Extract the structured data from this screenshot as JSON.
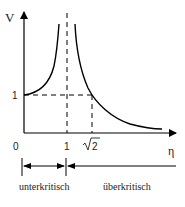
{
  "diagram": {
    "type": "resonance-curve",
    "y_axis": {
      "label": "V"
    },
    "x_axis": {
      "label": "η"
    },
    "y_ticks": [
      {
        "label": "1",
        "value": 1
      }
    ],
    "x_ticks": [
      {
        "label": "0",
        "value": 0
      },
      {
        "label": "1",
        "value": 1
      },
      {
        "label": "2",
        "prefix": "√",
        "value": 1.414
      }
    ],
    "regions": {
      "left": "unterkritisch",
      "right": "überkritisch"
    },
    "colors": {
      "line": "#000000",
      "background": "#ffffff",
      "text": "#222222"
    }
  }
}
